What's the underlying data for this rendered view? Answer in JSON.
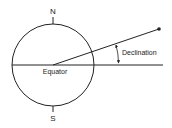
{
  "diagram": {
    "labels": {
      "north": "N",
      "south": "S",
      "equator": "Equator",
      "declination": "Declination"
    },
    "colors": {
      "stroke": "#222222",
      "background": "#ffffff"
    }
  }
}
